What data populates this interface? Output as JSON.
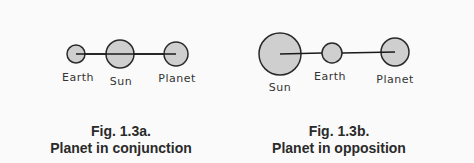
{
  "figures": [
    {
      "id": "fig-1-3a",
      "caption_number": "Fig. 1.3a.",
      "caption_title": "Planet in conjunction",
      "bodies": [
        {
          "label": "Earth",
          "cx": 76,
          "cy": 54,
          "r": 9,
          "lx": 78,
          "ly": 81
        },
        {
          "label": "Sun",
          "cx": 120,
          "cy": 54,
          "r": 14,
          "lx": 121,
          "ly": 85
        },
        {
          "label": "Planet",
          "cx": 176,
          "cy": 54,
          "r": 12,
          "lx": 177,
          "ly": 82
        }
      ],
      "line": {
        "x1": 76,
        "y1": 54,
        "x2": 176,
        "y2": 54
      }
    },
    {
      "id": "fig-1-3b",
      "caption_number": "Fig. 1.3b.",
      "caption_title": "Planet in opposition",
      "bodies": [
        {
          "label": "Sun",
          "cx": 280,
          "cy": 54,
          "r": 21,
          "lx": 280,
          "ly": 91
        },
        {
          "label": "Earth",
          "cx": 332,
          "cy": 53,
          "r": 10,
          "lx": 330,
          "ly": 80
        },
        {
          "label": "Planet",
          "cx": 395,
          "cy": 52,
          "r": 14,
          "lx": 395,
          "ly": 83
        }
      ],
      "line": {
        "x1": 280,
        "y1": 54,
        "x2": 395,
        "y2": 52
      }
    }
  ],
  "colors": {
    "fill": "#cfcfcf",
    "stroke": "#2a2a2a",
    "background": "#fafafa"
  }
}
